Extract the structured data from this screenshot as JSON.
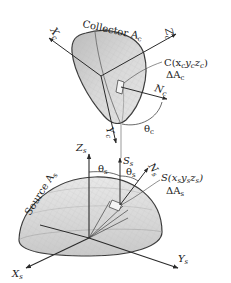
{
  "diagram": {
    "type": "geometry-radiation-view-factor",
    "colors": {
      "surface_fill": "#d4d4d4",
      "surface_stroke": "#3a3a3a",
      "axis": "#2a2a2a",
      "text": "#222222",
      "background": "#ffffff"
    },
    "collector": {
      "label": "Collector A",
      "label_sub": "c",
      "point_label": "C(x",
      "point_coords": [
        "c",
        "y",
        "c",
        "z",
        "c",
        ")"
      ],
      "area_label": "ΔA",
      "area_sub": "c",
      "axes": {
        "x": {
          "label": "X",
          "sub": "c"
        },
        "y": {
          "label": "Y",
          "sub": "c"
        },
        "z": {
          "label": "Z",
          "sub": "c"
        },
        "normal": {
          "label": "N",
          "sub": "c"
        }
      },
      "angle": {
        "label": "θ",
        "sub": "c"
      }
    },
    "source": {
      "label": "Source A",
      "label_sub": "s",
      "point_label": "S(x",
      "point_coords": [
        "s",
        "y",
        "s",
        "z",
        "s",
        ")"
      ],
      "area_label": "ΔA",
      "area_sub": "s",
      "axes": {
        "x": {
          "label": "X",
          "sub": "s"
        },
        "y": {
          "label": "Y",
          "sub": "s"
        },
        "z": {
          "label": "Z",
          "sub": "s"
        },
        "normal": {
          "label": "N",
          "sub": "s"
        },
        "s_dir": {
          "label": "S",
          "sub": "s"
        }
      },
      "angles": [
        {
          "label": "θ",
          "sub": "s"
        },
        {
          "label": "θ",
          "sub": "s"
        }
      ]
    }
  }
}
